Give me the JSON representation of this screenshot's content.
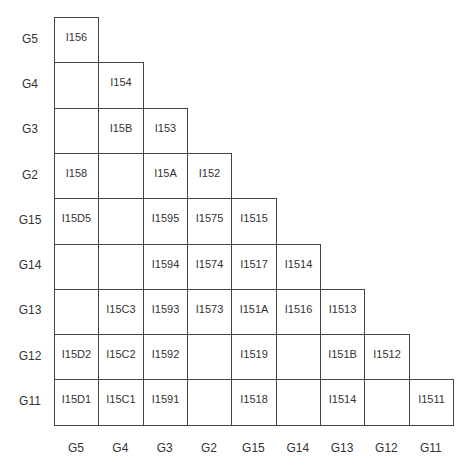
{
  "diagram": {
    "type": "lower-triangular-matrix",
    "row_labels": [
      "G5",
      "G4",
      "G3",
      "G2",
      "G15",
      "G14",
      "G13",
      "G12",
      "G11"
    ],
    "col_labels": [
      "G5",
      "G4",
      "G3",
      "G2",
      "G15",
      "G14",
      "G13",
      "G12",
      "G11"
    ],
    "cells": [
      [
        "I156"
      ],
      [
        "",
        "I154"
      ],
      [
        "",
        "I15B",
        "I153"
      ],
      [
        "I158",
        "",
        "I15A",
        "I152"
      ],
      [
        "I15D5",
        "",
        "I1595",
        "I1575",
        "I1515"
      ],
      [
        "",
        "",
        "I1594",
        "I1574",
        "I1517",
        "I1514"
      ],
      [
        "",
        "I15C3",
        "I1593",
        "I1573",
        "I151A",
        "I1516",
        "I1513"
      ],
      [
        "I15D2",
        "I15C2",
        "I1592",
        "",
        "I1519",
        "",
        "I151B",
        "I1512"
      ],
      [
        "I15D1",
        "I15C1",
        "I1591",
        "",
        "I1518",
        "",
        "I1514",
        "",
        "I1511"
      ]
    ],
    "colors": {
      "line": "#444444",
      "text": "#333333",
      "background": "#ffffff"
    }
  }
}
